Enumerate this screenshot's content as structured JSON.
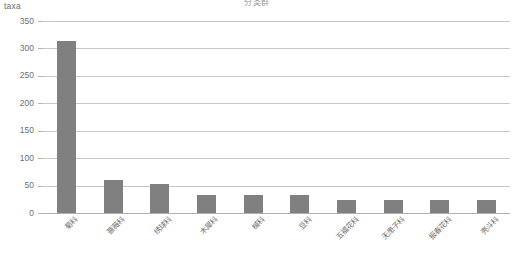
{
  "chart_data": {
    "type": "bar",
    "title": "分类群",
    "ylabel": "taxa",
    "xlabel": "",
    "ylim": [
      0,
      350
    ],
    "yticks": [
      0,
      50,
      100,
      150,
      200,
      250,
      300,
      350
    ],
    "grid": true,
    "legend": "none",
    "bar_color": "#808080",
    "gridline_color": "#c8c8c8",
    "text_color": "#6f6f6f",
    "background": "#ffffff",
    "categories": [
      "菊科",
      "蔷薇科",
      "绣球科",
      "木犀科",
      "槭科",
      "豆科",
      "五福花科",
      "无患子科",
      "报春花科",
      "壳斗科"
    ],
    "values": [
      313,
      60,
      52,
      32,
      32,
      32,
      24,
      24,
      23,
      23
    ]
  }
}
